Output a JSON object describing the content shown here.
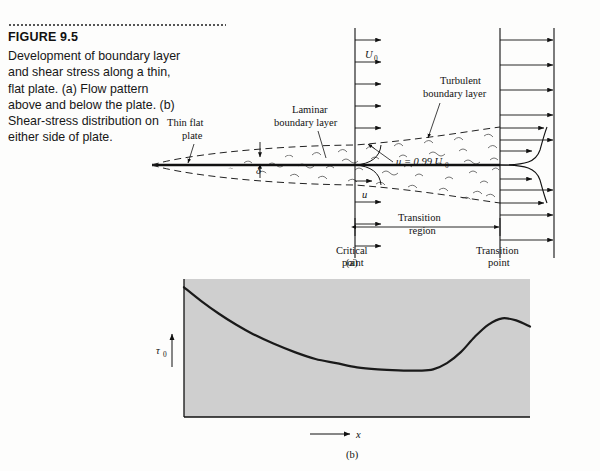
{
  "figure": {
    "number": "FIGURE 9.5",
    "caption": "Development of boundary layer and shear stress along a thin, flat plate. (a) Flow pattern above and below the plate. (b) Shear-stress distribution on either side of plate."
  },
  "panel_a": {
    "caption": "(a)",
    "labels": {
      "thin_flat_plate": "Thin flat\nplate",
      "thin_flat_plate_line1": "Thin flat",
      "thin_flat_plate_line2": "plate",
      "laminar_line1": "Laminar",
      "laminar_line2": "boundary layer",
      "turbulent_line1": "Turbulent",
      "turbulent_line2": "boundary layer",
      "freestream_velocity": "U",
      "freestream_velocity_sub": "0",
      "boundary_thickness": "δ",
      "local_velocity": "u",
      "edge_condition": "u = 0.99 U",
      "edge_condition_sub": "0",
      "transition_region_line1": "Transition",
      "transition_region_line2": "region",
      "critical_point_line1": "Critical",
      "critical_point_line2": "point",
      "transition_point_line1": "Transition",
      "transition_point_line2": "point"
    }
  },
  "panel_b": {
    "caption": "(b)",
    "y_axis_label": "τ",
    "y_axis_label_sub": "0",
    "x_axis_label": "x",
    "plot_background": "#cfcfcf"
  },
  "chart_data": {
    "type": "line",
    "title": "",
    "xlabel": "x",
    "ylabel": "τ₀",
    "grid": false,
    "legend": false,
    "xlim": [
      0,
      1
    ],
    "ylim": [
      0,
      1
    ],
    "series": [
      {
        "name": "wall shear stress",
        "x": [
          0.0,
          0.05,
          0.1,
          0.15,
          0.2,
          0.26,
          0.32,
          0.38,
          0.44,
          0.5,
          0.56,
          0.62,
          0.68,
          0.72,
          0.76,
          0.8,
          0.84,
          0.88,
          0.92,
          0.96,
          1.0
        ],
        "y": [
          0.94,
          0.84,
          0.75,
          0.67,
          0.6,
          0.53,
          0.47,
          0.42,
          0.39,
          0.36,
          0.345,
          0.338,
          0.336,
          0.345,
          0.39,
          0.47,
          0.58,
          0.67,
          0.715,
          0.7,
          0.655
        ]
      }
    ],
    "annotations": [
      "laminar decay then turbulent rise at transition, peak near x = 0.92"
    ]
  }
}
